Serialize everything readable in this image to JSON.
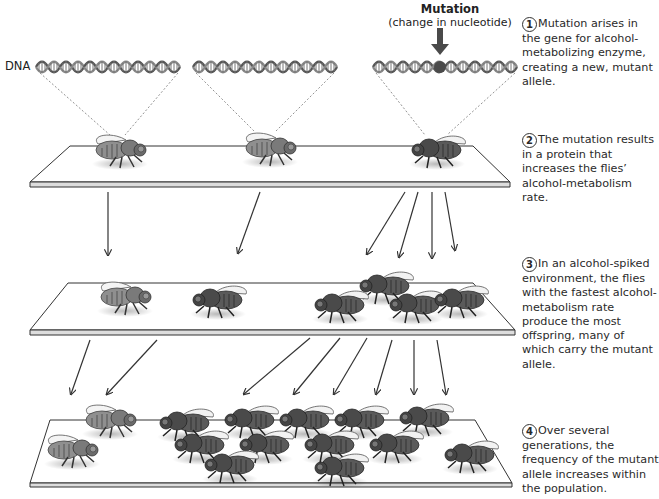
{
  "figure": {
    "mutation_label": {
      "title": "Mutation",
      "subtitle": "(change in nucleotide)"
    },
    "dna_label": "DNA",
    "steps": [
      {
        "number": "1",
        "text": "Mutation arises in the gene for alcohol-metabolizing enzyme, creating a new, mutant allele."
      },
      {
        "number": "2",
        "text": "The mutation results in a protein that increases the flies’ alcohol-metabolism rate."
      },
      {
        "number": "3",
        "text": "In an alcohol-spiked environment, the flies with the fastest alcohol-metabolism rate produce the most offspring, many of which carry the mutant allele."
      },
      {
        "number": "4",
        "text": "Over several generations, the frequency of the mutant allele increases within the population."
      }
    ],
    "generations": [
      {
        "label": "parent generation",
        "wild_type_flies": 2,
        "mutant_flies": 1
      },
      {
        "label": "offspring generation",
        "wild_type_flies": 2,
        "mutant_flies": 4
      },
      {
        "label": "later generations",
        "wild_type_flies": 2,
        "mutant_flies": 14
      }
    ],
    "colors": {
      "dna_strand": "#6e6e6e",
      "mutation_marker": "#4a4a4a",
      "wild_fly_body": "#8a8a8a",
      "mutant_fly_body": "#555555",
      "platform_edge": "#333333",
      "arrow": "#333333",
      "text": "#2a2a2a"
    }
  }
}
